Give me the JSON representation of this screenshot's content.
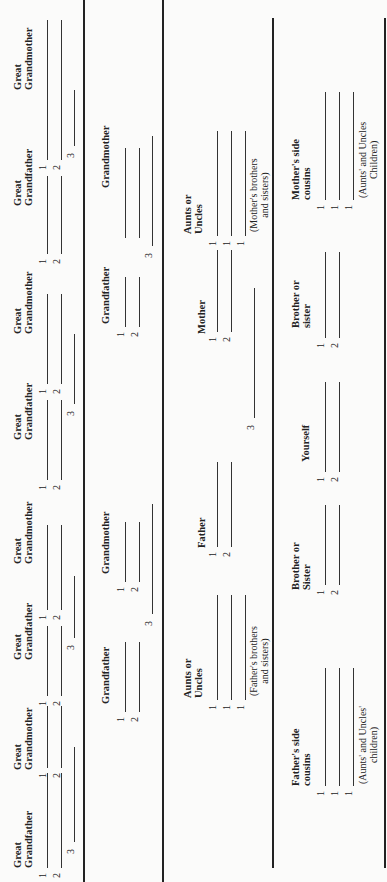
{
  "form": {
    "great_grandparents": [
      {
        "label": "Great Grandfather",
        "nums": [
          "1",
          "2"
        ],
        "third": "3"
      },
      {
        "label": "Great Grandmother",
        "nums": [
          "1",
          "2"
        ]
      },
      {
        "label": "Great Grandfather",
        "nums": [
          "1",
          "2"
        ],
        "third": "3"
      },
      {
        "label": "Great Grandmother",
        "nums": [
          "1",
          "2"
        ]
      },
      {
        "label": "Great Grandfather",
        "nums": [
          "1",
          "2"
        ],
        "third": "3"
      },
      {
        "label": "Great Grandmother",
        "nums": [
          "1",
          "2"
        ]
      },
      {
        "label": "Great Grandfather",
        "nums": [
          "1",
          "2"
        ],
        "third": "3"
      },
      {
        "label": "Great Grandmother",
        "nums": [
          "1",
          "2"
        ]
      }
    ],
    "grandparents": [
      {
        "label": "Grandfather",
        "nums": [
          "1",
          "2"
        ],
        "third": "3"
      },
      {
        "label": "Grandmother",
        "nums": [
          "1",
          "2"
        ]
      },
      {
        "label": "Grandfather",
        "nums": [
          "1",
          "2"
        ],
        "third": "3"
      },
      {
        "label": "Grandmother",
        "nums": [
          "",
          ""
        ]
      }
    ],
    "parents_row": {
      "father_aunts": {
        "label1": "Aunts or",
        "label2": "Uncles",
        "nums": [
          "1",
          "1",
          "1"
        ],
        "note1": "(Father's brothers",
        "note2": "and sisters)"
      },
      "father": {
        "label": "Father",
        "nums": [
          "1",
          "2"
        ],
        "third": "3"
      },
      "mother": {
        "label": "Mother",
        "nums": [
          "1",
          "2"
        ]
      },
      "mother_aunts": {
        "label1": "Aunts or",
        "label2": "Uncles",
        "nums": [
          "1",
          "1",
          "1"
        ],
        "note1": "(Mother's brothers",
        "note2": "and sisters)"
      }
    },
    "self_row": {
      "father_cousins": {
        "label1": "Father's side",
        "label2": "cousins",
        "nums": [
          "1",
          "1",
          "1"
        ],
        "note1": "(Aunts' and Uncles'",
        "note2": "children)"
      },
      "brother_sister_left": {
        "label1": "Brother or",
        "label2": "Sister",
        "nums": [
          "1",
          "2"
        ]
      },
      "yourself": {
        "label": "Yourself",
        "nums": [
          "1",
          "2"
        ]
      },
      "brother_sister_right": {
        "label1": "Brother or",
        "label2": "sister",
        "nums": [
          "1",
          "2"
        ]
      },
      "mother_cousins": {
        "label1": "Mother's side",
        "label2": "cousins",
        "nums": [
          "1",
          "1",
          "1"
        ],
        "note1": "(Aunts' and Uncles",
        "note2": "Children)"
      }
    }
  }
}
